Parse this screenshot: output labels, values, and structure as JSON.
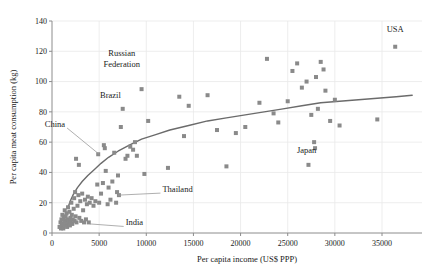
{
  "chart_data": {
    "type": "scatter",
    "title": "",
    "xlabel": "Per capita income (US$ PPP)",
    "ylabel": "Per capita meat consumption (kg)",
    "xlim": [
      0,
      38500
    ],
    "ylim": [
      0,
      145
    ],
    "xticks": [
      0,
      5000,
      10000,
      15000,
      20000,
      25000,
      30000,
      35000
    ],
    "xtick_labels": [
      "0",
      "5000",
      "10000",
      "15000",
      "20000",
      "25000",
      "30000",
      "35000"
    ],
    "yticks": [
      0,
      20,
      40,
      60,
      80,
      100,
      120,
      140
    ],
    "ytick_labels": [
      "0",
      "20",
      "40",
      "60",
      "80",
      "100",
      "120",
      "140"
    ],
    "grid": true,
    "grid_color": "#e8e8e8",
    "axis_color": "#8c8c8c",
    "marker": "square",
    "marker_color": "#8a8a8a",
    "marker_size": 4,
    "trend": {
      "type": "logarithmic",
      "color": "#6b6b6b",
      "width": 1.4,
      "points": [
        [
          1700,
          17
        ],
        [
          2000,
          22
        ],
        [
          2300,
          26
        ],
        [
          2700,
          30
        ],
        [
          3200,
          34
        ],
        [
          3800,
          38
        ],
        [
          4500,
          42
        ],
        [
          5200,
          46
        ],
        [
          6000,
          50
        ],
        [
          7000,
          54
        ],
        [
          8200,
          58
        ],
        [
          9500,
          62
        ],
        [
          11000,
          65
        ],
        [
          12500,
          68
        ],
        [
          14500,
          71
        ],
        [
          16500,
          74
        ],
        [
          18500,
          76
        ],
        [
          20500,
          78
        ],
        [
          22500,
          80
        ],
        [
          24500,
          82
        ],
        [
          26500,
          84
        ],
        [
          28500,
          86
        ],
        [
          30500,
          87
        ],
        [
          32500,
          88
        ],
        [
          34500,
          89
        ],
        [
          36500,
          90
        ],
        [
          38200,
          91
        ]
      ]
    },
    "points": [
      [
        800,
        4
      ],
      [
        900,
        7
      ],
      [
        950,
        3
      ],
      [
        1000,
        9
      ],
      [
        1050,
        5
      ],
      [
        1100,
        12
      ],
      [
        1150,
        6
      ],
      [
        1200,
        3
      ],
      [
        1250,
        10
      ],
      [
        1300,
        8
      ],
      [
        1350,
        15
      ],
      [
        1400,
        5
      ],
      [
        1450,
        11
      ],
      [
        1500,
        7
      ],
      [
        1550,
        13
      ],
      [
        1600,
        4
      ],
      [
        1650,
        9
      ],
      [
        1700,
        17
      ],
      [
        1750,
        6
      ],
      [
        1800,
        8
      ],
      [
        1850,
        14
      ],
      [
        1900,
        5
      ],
      [
        1950,
        10
      ],
      [
        2000,
        7
      ],
      [
        2050,
        20
      ],
      [
        2100,
        12
      ],
      [
        2150,
        6
      ],
      [
        2200,
        9
      ],
      [
        2300,
        16
      ],
      [
        2350,
        23
      ],
      [
        2400,
        8
      ],
      [
        2450,
        27
      ],
      [
        2500,
        11
      ],
      [
        2550,
        49
      ],
      [
        2600,
        7
      ],
      [
        2700,
        18
      ],
      [
        2800,
        25
      ],
      [
        2850,
        45
      ],
      [
        2900,
        10
      ],
      [
        3000,
        21
      ],
      [
        3100,
        8
      ],
      [
        3200,
        26
      ],
      [
        3300,
        15
      ],
      [
        3400,
        7
      ],
      [
        3500,
        22
      ],
      [
        3600,
        9
      ],
      [
        3700,
        19
      ],
      [
        3800,
        24
      ],
      [
        3900,
        7
      ],
      [
        4000,
        20
      ],
      [
        4200,
        23
      ],
      [
        4400,
        18
      ],
      [
        4600,
        21
      ],
      [
        4800,
        32
      ],
      [
        4900,
        52
      ],
      [
        5000,
        20
      ],
      [
        5200,
        26
      ],
      [
        5400,
        33
      ],
      [
        5500,
        58
      ],
      [
        5600,
        56
      ],
      [
        5700,
        41
      ],
      [
        5900,
        19
      ],
      [
        6000,
        30
      ],
      [
        6200,
        22
      ],
      [
        6400,
        34
      ],
      [
        6600,
        53
      ],
      [
        6800,
        20
      ],
      [
        6900,
        27
      ],
      [
        7000,
        38
      ],
      [
        7100,
        25
      ],
      [
        7300,
        70
      ],
      [
        7500,
        82
      ],
      [
        7800,
        49
      ],
      [
        8000,
        51
      ],
      [
        8300,
        57
      ],
      [
        8600,
        55
      ],
      [
        8800,
        60
      ],
      [
        9000,
        51
      ],
      [
        9500,
        95
      ],
      [
        9800,
        39
      ],
      [
        10200,
        74
      ],
      [
        12300,
        43
      ],
      [
        13500,
        90
      ],
      [
        14000,
        64
      ],
      [
        14500,
        84
      ],
      [
        16500,
        91
      ],
      [
        17500,
        68
      ],
      [
        18500,
        44
      ],
      [
        19500,
        66
      ],
      [
        20500,
        70
      ],
      [
        22000,
        86
      ],
      [
        22800,
        115
      ],
      [
        23500,
        79
      ],
      [
        24000,
        73
      ],
      [
        25000,
        87
      ],
      [
        25500,
        107
      ],
      [
        26000,
        112
      ],
      [
        26500,
        96
      ],
      [
        27000,
        100
      ],
      [
        27200,
        45
      ],
      [
        27500,
        78
      ],
      [
        27800,
        60
      ],
      [
        27900,
        56
      ],
      [
        28000,
        103
      ],
      [
        28200,
        82
      ],
      [
        28500,
        113
      ],
      [
        28800,
        108
      ],
      [
        29000,
        94
      ],
      [
        29500,
        74
      ],
      [
        30000,
        88
      ],
      [
        30500,
        71
      ],
      [
        34500,
        75
      ],
      [
        36400,
        123
      ]
    ],
    "annotations": [
      {
        "label": "USA",
        "label_x": 36400,
        "label_y": 133,
        "point_x": 36400,
        "point_y": 123,
        "leader": false
      },
      {
        "label": "Russian Federation",
        "label_x": 7400,
        "label_y": 117,
        "point_x": 7500,
        "point_y": 82,
        "leader": false,
        "two_line": true
      },
      {
        "label": "Brazil",
        "label_x": 6200,
        "label_y": 89,
        "point_x": 7500,
        "point_y": 82,
        "leader": false
      },
      {
        "label": "China",
        "label_x": 1600,
        "label_y": 70,
        "point_x": 5000,
        "point_y": 52,
        "leader": true
      },
      {
        "label": "Thailand",
        "label_x": 11500,
        "label_y": 27,
        "point_x": 7000,
        "point_y": 25,
        "leader": true
      },
      {
        "label": "India",
        "label_x": 7600,
        "label_y": 5,
        "point_x": 4000,
        "point_y": 6,
        "leader": true
      },
      {
        "label": "Japan",
        "label_x": 27000,
        "label_y": 53,
        "point_x": 27200,
        "point_y": 45,
        "leader": false
      }
    ]
  }
}
